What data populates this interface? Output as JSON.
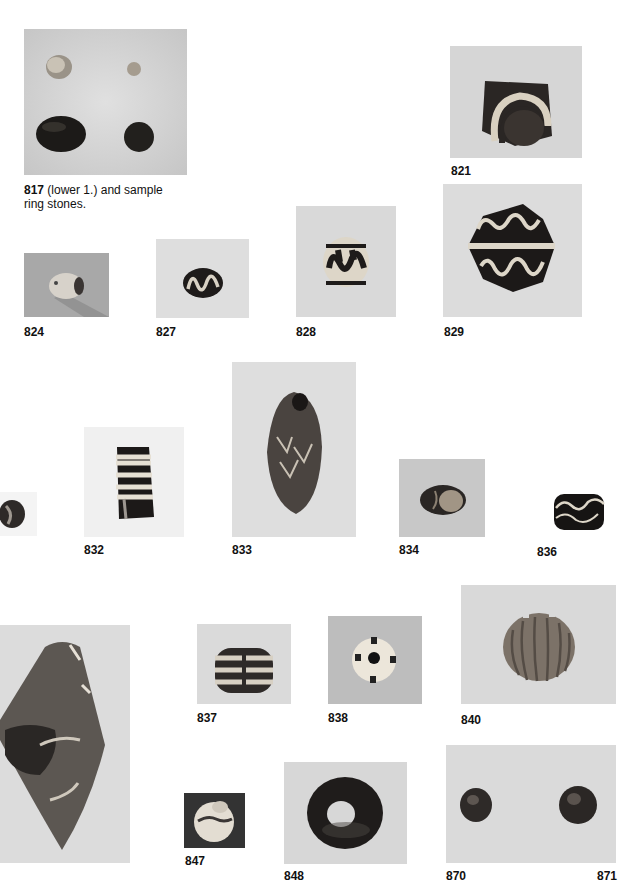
{
  "page": {
    "type": "catalog plate",
    "top_line_cropped": true
  },
  "figures": [
    {
      "id": "817",
      "caption_number": "817",
      "caption_text": " (lower 1.) and sample",
      "caption_text_line2": "ring stones.",
      "bg": "#d3d3d3"
    },
    {
      "id": "821",
      "caption_number": "821",
      "bg": "#d6d6d6"
    },
    {
      "id": "824",
      "caption_number": "824",
      "bg": "#a9a9a9"
    },
    {
      "id": "827",
      "caption_number": "827",
      "bg": "#dedede"
    },
    {
      "id": "828",
      "caption_number": "828",
      "bg": "#d9d9d9"
    },
    {
      "id": "829",
      "caption_number": "829",
      "bg": "#dcdcdc"
    },
    {
      "id": "831",
      "caption_number": "",
      "bg": "#f4f4f4"
    },
    {
      "id": "832",
      "caption_number": "832",
      "bg": "#f0f0f0"
    },
    {
      "id": "833",
      "caption_number": "833",
      "bg": "#dedede"
    },
    {
      "id": "834",
      "caption_number": "834",
      "bg": "#c8c8c8"
    },
    {
      "id": "836",
      "caption_number": "836",
      "bg": "#ffffff"
    },
    {
      "id": "835",
      "caption_number": "",
      "bg": "#dcdcdc"
    },
    {
      "id": "837",
      "caption_number": "837",
      "bg": "#dadada"
    },
    {
      "id": "838",
      "caption_number": "838",
      "bg": "#bdbdbd"
    },
    {
      "id": "840",
      "caption_number": "840",
      "bg": "#d9d9d9"
    },
    {
      "id": "847",
      "caption_number": "847",
      "bg": "#333333"
    },
    {
      "id": "848",
      "caption_number": "848",
      "bg": "#d7d7d7"
    },
    {
      "id": "870-871",
      "caption_number": "870",
      "caption_number_2": "871",
      "bg": "#dadada"
    }
  ]
}
